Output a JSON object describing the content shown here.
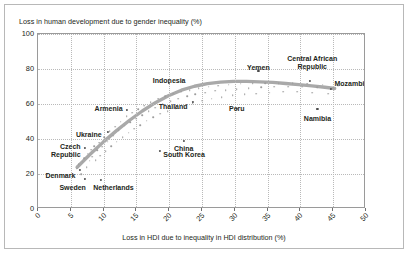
{
  "chart_data": {
    "type": "scatter",
    "title": "Loss in human development due to gender inequality (%)",
    "xlabel": "Loss in HDI due to inequality in HDI distribution (%)",
    "ylabel": "Loss in human development due to gender inequality (%)",
    "xlim": [
      0,
      50
    ],
    "ylim": [
      0,
      100
    ],
    "xticks": [
      "0",
      "5",
      "10",
      "15",
      "20",
      "25",
      "30",
      "35",
      "40",
      "45",
      "50"
    ],
    "yticks": [
      "0",
      "20",
      "40",
      "60",
      "80",
      "100"
    ],
    "grid": true,
    "legend": "none",
    "labeled_points": [
      {
        "name": "Denmark",
        "x": 6.4,
        "y": 22.5,
        "label_x": 6.0,
        "label_y": 21.0,
        "align": "right"
      },
      {
        "name": "Sweden",
        "x": 7.2,
        "y": 17.0,
        "label_x": 7.6,
        "label_y": 14.5,
        "align": "right"
      },
      {
        "name": "Czech\nRepublic",
        "x": 7.2,
        "y": 35.0,
        "label_x": 6.8,
        "label_y": 38.0,
        "align": "right"
      },
      {
        "name": "Netherlands",
        "x": 9.6,
        "y": 16.5,
        "label_x": 11.5,
        "label_y": 14.5,
        "align": "center"
      },
      {
        "name": "Ukraine",
        "x": 10.6,
        "y": 44.0,
        "label_x": 10.0,
        "label_y": 44.5,
        "align": "right"
      },
      {
        "name": "Armenia",
        "x": 13.5,
        "y": 56.5,
        "label_x": 13.2,
        "label_y": 59.5,
        "align": "right"
      },
      {
        "name": "South Korea",
        "x": 18.6,
        "y": 33.0,
        "label_x": 19.1,
        "label_y": 33.0,
        "align": "left"
      },
      {
        "name": "Indonesia",
        "x": 20.0,
        "y": 72.0,
        "label_x": 20.0,
        "label_y": 75.5,
        "align": "center"
      },
      {
        "name": "China",
        "x": 22.2,
        "y": 39.0,
        "label_x": 22.2,
        "label_y": 36.5,
        "align": "center"
      },
      {
        "name": "Thailand",
        "x": 23.6,
        "y": 61.0,
        "label_x": 23.1,
        "label_y": 60.5,
        "align": "right"
      },
      {
        "name": "Peru",
        "x": 30.3,
        "y": 57.0,
        "label_x": 30.3,
        "label_y": 59.5,
        "align": "center"
      },
      {
        "name": "Yemen",
        "x": 33.6,
        "y": 79.0,
        "label_x": 33.6,
        "label_y": 83.0,
        "align": "center"
      },
      {
        "name": "Central African\nRepublic",
        "x": 41.4,
        "y": 73.0,
        "label_x": 41.8,
        "label_y": 88.0,
        "align": "center"
      },
      {
        "name": "Namibia",
        "x": 42.6,
        "y": 57.0,
        "label_x": 42.6,
        "label_y": 54.0,
        "align": "center"
      },
      {
        "name": "Mozambique",
        "x": 44.6,
        "y": 68.5,
        "label_x": 45.2,
        "label_y": 74.0,
        "align": "left"
      }
    ],
    "cloud_points": [
      [
        5.9,
        23.0
      ],
      [
        6.2,
        25.5
      ],
      [
        6.6,
        20.0
      ],
      [
        6.8,
        27.0
      ],
      [
        7.0,
        29.0
      ],
      [
        7.4,
        24.0
      ],
      [
        7.6,
        31.5
      ],
      [
        7.9,
        27.5
      ],
      [
        8.1,
        34.0
      ],
      [
        8.3,
        30.0
      ],
      [
        8.6,
        36.0
      ],
      [
        8.8,
        28.0
      ],
      [
        9.0,
        33.5
      ],
      [
        9.3,
        38.0
      ],
      [
        9.5,
        30.5
      ],
      [
        9.8,
        35.5
      ],
      [
        10.1,
        41.0
      ],
      [
        10.3,
        33.0
      ],
      [
        10.6,
        38.5
      ],
      [
        10.9,
        44.5
      ],
      [
        11.2,
        36.0
      ],
      [
        11.5,
        42.0
      ],
      [
        11.8,
        47.0
      ],
      [
        12.0,
        38.5
      ],
      [
        12.3,
        45.0
      ],
      [
        12.6,
        50.0
      ],
      [
        12.9,
        41.0
      ],
      [
        13.2,
        47.5
      ],
      [
        13.5,
        53.0
      ],
      [
        13.8,
        43.5
      ],
      [
        14.1,
        49.5
      ],
      [
        14.4,
        55.0
      ],
      [
        14.7,
        46.0
      ],
      [
        15.0,
        51.5
      ],
      [
        15.3,
        57.0
      ],
      [
        15.6,
        48.0
      ],
      [
        15.9,
        53.5
      ],
      [
        16.2,
        59.0
      ],
      [
        16.6,
        50.5
      ],
      [
        16.9,
        56.0
      ],
      [
        17.2,
        61.0
      ],
      [
        17.6,
        52.5
      ],
      [
        17.9,
        58.0
      ],
      [
        18.3,
        63.0
      ],
      [
        18.6,
        54.5
      ],
      [
        19.0,
        60.0
      ],
      [
        19.4,
        64.5
      ],
      [
        19.8,
        56.0
      ],
      [
        20.2,
        61.5
      ],
      [
        20.6,
        66.0
      ],
      [
        21.0,
        57.5
      ],
      [
        21.4,
        63.0
      ],
      [
        21.8,
        67.0
      ],
      [
        22.2,
        59.0
      ],
      [
        22.7,
        64.5
      ],
      [
        23.1,
        68.0
      ],
      [
        23.6,
        60.5
      ],
      [
        24.0,
        65.5
      ],
      [
        24.5,
        69.0
      ],
      [
        25.0,
        62.0
      ],
      [
        25.5,
        66.5
      ],
      [
        26.0,
        70.0
      ],
      [
        26.5,
        63.0
      ],
      [
        27.0,
        67.5
      ],
      [
        27.5,
        70.5
      ],
      [
        28.0,
        64.0
      ],
      [
        28.6,
        68.0
      ],
      [
        29.1,
        71.0
      ],
      [
        29.7,
        65.0
      ],
      [
        30.3,
        68.5
      ],
      [
        30.9,
        71.5
      ],
      [
        31.5,
        65.5
      ],
      [
        32.1,
        69.0
      ],
      [
        32.7,
        72.0
      ],
      [
        33.3,
        66.0
      ],
      [
        34.0,
        69.5
      ],
      [
        34.6,
        72.0
      ],
      [
        35.3,
        66.5
      ],
      [
        36.0,
        70.0
      ],
      [
        36.7,
        72.0
      ],
      [
        37.4,
        67.0
      ],
      [
        38.1,
        70.0
      ],
      [
        38.8,
        72.0
      ],
      [
        39.5,
        67.0
      ],
      [
        40.3,
        70.0
      ],
      [
        41.0,
        71.5
      ],
      [
        41.8,
        66.5
      ],
      [
        42.6,
        69.5
      ],
      [
        43.4,
        71.0
      ],
      [
        44.2,
        66.0
      ],
      [
        45.0,
        69.0
      ],
      [
        45.8,
        70.5
      ]
    ],
    "trend_line": {
      "description": "fitted quadratic trend band",
      "color": "#a9a9a9",
      "points": [
        [
          6.0,
          23.0
        ],
        [
          8.0,
          30.5
        ],
        [
          10.0,
          37.5
        ],
        [
          12.0,
          44.0
        ],
        [
          14.0,
          50.0
        ],
        [
          16.0,
          55.5
        ],
        [
          18.0,
          60.3
        ],
        [
          20.0,
          64.3
        ],
        [
          22.0,
          67.5
        ],
        [
          24.0,
          69.8
        ],
        [
          26.0,
          71.3
        ],
        [
          28.0,
          72.2
        ],
        [
          30.0,
          72.6
        ],
        [
          32.0,
          72.6
        ],
        [
          34.0,
          72.3
        ],
        [
          36.0,
          72.0
        ],
        [
          38.0,
          71.4
        ],
        [
          40.0,
          70.7
        ],
        [
          42.0,
          70.0
        ],
        [
          44.0,
          69.2
        ],
        [
          45.5,
          68.5
        ]
      ]
    }
  }
}
